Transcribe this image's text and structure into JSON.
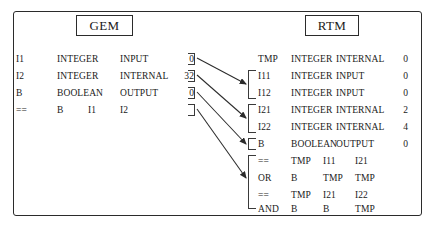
{
  "figure": {
    "gem_panel": {
      "title": "GEM",
      "declarations": [
        {
          "name": "I1",
          "type": "INTEGER",
          "kind": "INPUT",
          "value": "0"
        },
        {
          "name": "I2",
          "type": "INTEGER",
          "kind": "INTERNAL",
          "value": "32"
        },
        {
          "name": "B",
          "type": "BOOLEAN",
          "kind": "OUTPUT",
          "value": "0"
        }
      ],
      "operations": [
        {
          "op": "==",
          "dest": "B",
          "src1": "I1",
          "src2": "I2"
        }
      ]
    },
    "rtm_panel": {
      "title": "RTM",
      "declarations": [
        {
          "name": "TMP",
          "type": "INTEGER",
          "kind": "INTERNAL",
          "value": "0"
        },
        {
          "name": "I11",
          "type": "INTEGER",
          "kind": "INPUT",
          "value": "0"
        },
        {
          "name": "I12",
          "type": "INTEGER",
          "kind": "INPUT",
          "value": "0"
        },
        {
          "name": "I21",
          "type": "INTEGER",
          "kind": "INTERNAL",
          "value": "2"
        },
        {
          "name": "I22",
          "type": "INTEGER",
          "kind": "INTERNAL",
          "value": "4"
        },
        {
          "name": "B",
          "type": "BOOLEAN",
          "kind": "OUTPUT",
          "value": "0"
        }
      ],
      "operations": [
        {
          "op": "==",
          "dest": "TMP",
          "src1": "I11",
          "src2": "I21"
        },
        {
          "op": "OR",
          "dest": "B",
          "src1": "TMP",
          "src2": "TMP"
        },
        {
          "op": "==",
          "dest": "TMP",
          "src1": "I21",
          "src2": "I22"
        },
        {
          "op": "AND",
          "dest": "B",
          "src1": "B",
          "src2": "TMP"
        }
      ]
    },
    "mappings": [
      {
        "from": "I1 declaration",
        "to": "I11 / I12 group"
      },
      {
        "from": "I2 declaration",
        "to": "I21 / I22 group"
      },
      {
        "from": "B declaration",
        "to": "B group"
      },
      {
        "from": "== operation",
        "to": "operations group"
      }
    ],
    "colors": {
      "stroke": "#2b2b2b",
      "text": "#1a1a1a",
      "background": "#ffffff"
    }
  }
}
